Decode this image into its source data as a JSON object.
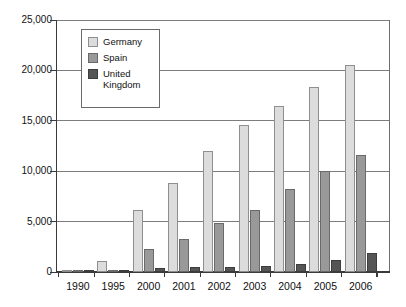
{
  "chart_data": {
    "type": "bar",
    "title": "",
    "subtitle": "",
    "xlabel": "",
    "ylabel": "",
    "ylim": [
      0,
      25000
    ],
    "yticks": [
      "0",
      "5,000",
      "10,000",
      "15,000",
      "20,000",
      "25,000"
    ],
    "ytick_values": [
      0,
      5000,
      10000,
      15000,
      20000,
      25000
    ],
    "grid": true,
    "legend_position": "top-left-inside",
    "categories": [
      "1990",
      "1995",
      "2000",
      "2001",
      "2002",
      "2003",
      "2004",
      "2005",
      "2006"
    ],
    "series": [
      {
        "name": "Germany",
        "color": "#dcdcdc",
        "values": [
          100,
          1100,
          6200,
          8800,
          12000,
          14600,
          16500,
          18400,
          20500
        ]
      },
      {
        "name": "Spain",
        "color": "#999999",
        "values": [
          60,
          180,
          2250,
          3300,
          4850,
          6150,
          8200,
          10000,
          11600
        ]
      },
      {
        "name": "United Kingdom",
        "color": "#555555",
        "values": [
          50,
          160,
          400,
          480,
          500,
          570,
          790,
          1200,
          1900
        ]
      }
    ]
  },
  "legend": {
    "entries": [
      {
        "label": "Germany",
        "swatch": "germany"
      },
      {
        "label": "Spain",
        "swatch": "spain"
      },
      {
        "label": "United Kingdom",
        "swatch": "uk"
      }
    ]
  }
}
